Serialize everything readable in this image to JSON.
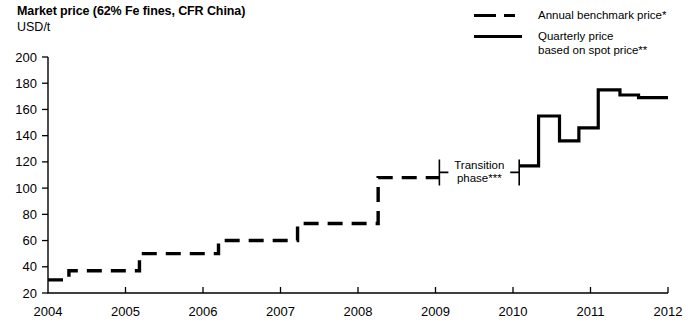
{
  "header": {
    "title": "Market price (62% Fe fines, CFR China)",
    "unit": "USD/t"
  },
  "legend": [
    {
      "key": "dashed-line-key",
      "label": "Annual benchmark price*"
    },
    {
      "key": "solid-line-key",
      "label": "Quarterly price\nbased on spot price**"
    }
  ],
  "annotation": {
    "label": "Transition\nphase***",
    "start_x": 2009.05,
    "end_x": 2010.08,
    "y": 112
  },
  "chart_data": {
    "type": "line",
    "title": "Market price (62% Fe fines, CFR China)",
    "xlabel": "",
    "ylabel": "USD/t",
    "xlim": [
      2004,
      2012
    ],
    "ylim": [
      20,
      200
    ],
    "ytick_step": 20,
    "yticks": [
      20,
      40,
      60,
      80,
      100,
      120,
      140,
      160,
      180,
      200
    ],
    "xticks": [
      2004,
      2005,
      2006,
      2007,
      2008,
      2009,
      2010,
      2011,
      2012
    ],
    "grid": false,
    "legend_position": "top-right",
    "series": [
      {
        "name": "Annual benchmark price*",
        "style": "dashed",
        "step": "post",
        "points": [
          {
            "x": 2004.0,
            "y": 30
          },
          {
            "x": 2004.27,
            "y": 30
          },
          {
            "x": 2004.27,
            "y": 37
          },
          {
            "x": 2005.18,
            "y": 37
          },
          {
            "x": 2005.18,
            "y": 50
          },
          {
            "x": 2006.2,
            "y": 50
          },
          {
            "x": 2006.2,
            "y": 60
          },
          {
            "x": 2007.22,
            "y": 60
          },
          {
            "x": 2007.22,
            "y": 73
          },
          {
            "x": 2008.26,
            "y": 73
          },
          {
            "x": 2008.26,
            "y": 108
          },
          {
            "x": 2009.05,
            "y": 108
          },
          {
            "x": 2009.05,
            "y": 108
          }
        ]
      },
      {
        "name": "Quarterly price based on spot price**",
        "style": "solid",
        "step": "post",
        "points": [
          {
            "x": 2010.08,
            "y": 117
          },
          {
            "x": 2010.33,
            "y": 117
          },
          {
            "x": 2010.33,
            "y": 155
          },
          {
            "x": 2010.6,
            "y": 155
          },
          {
            "x": 2010.6,
            "y": 136
          },
          {
            "x": 2010.85,
            "y": 136
          },
          {
            "x": 2010.85,
            "y": 146
          },
          {
            "x": 2011.1,
            "y": 146
          },
          {
            "x": 2011.1,
            "y": 175
          },
          {
            "x": 2011.38,
            "y": 175
          },
          {
            "x": 2011.38,
            "y": 171
          },
          {
            "x": 2011.62,
            "y": 171
          },
          {
            "x": 2011.62,
            "y": 169
          },
          {
            "x": 2012.0,
            "y": 169
          }
        ]
      }
    ]
  }
}
